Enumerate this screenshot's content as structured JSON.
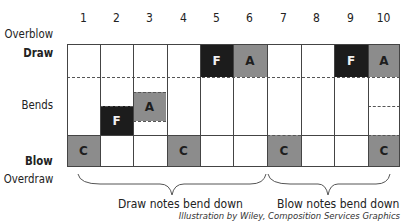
{
  "columns": [
    "1",
    "2",
    "3",
    "4",
    "5",
    "6",
    "7",
    "8",
    "9",
    "10"
  ],
  "row_labels": {
    "overblow": "Overblow",
    "draw": "Draw",
    "bends": "Bends",
    "blow": "Blow",
    "overdraw": "Overdraw"
  },
  "notes": {
    "draw": [
      {
        "hole": 5,
        "label": "F",
        "style": "dark"
      },
      {
        "hole": 6,
        "label": "A",
        "style": "gray"
      },
      {
        "hole": 9,
        "label": "F",
        "style": "dark"
      },
      {
        "hole": 10,
        "label": "A",
        "style": "gray"
      }
    ],
    "bends": [
      {
        "hole": 2,
        "label": "F",
        "style": "dark"
      },
      {
        "hole": 3,
        "label": "A",
        "style": "gray"
      }
    ],
    "blow": [
      {
        "hole": 1,
        "label": "C",
        "style": "gray"
      },
      {
        "hole": 4,
        "label": "C",
        "style": "gray"
      },
      {
        "hole": 7,
        "label": "C",
        "style": "gray"
      },
      {
        "hole": 10,
        "label": "C",
        "style": "gray"
      }
    ]
  },
  "braces": {
    "draw_label": "Draw notes bend down",
    "blow_label": "Blow notes bend down"
  },
  "credit": "Illustration by Wiley, Composition Services Graphics",
  "colors": {
    "dark": "#1c1c1c",
    "gray": "#8c8c8c",
    "grid": "#444444"
  }
}
